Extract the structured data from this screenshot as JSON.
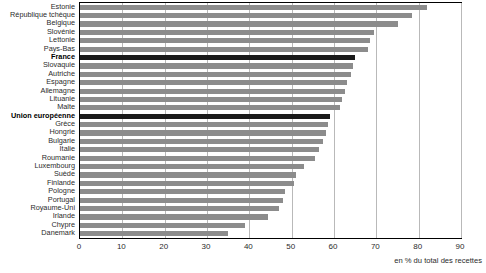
{
  "chart_data": {
    "type": "bar",
    "orientation": "horizontal",
    "title": "",
    "xlabel": "en % du total des recettes",
    "ylabel": "",
    "xlim": [
      0,
      90
    ],
    "xticks": [
      0,
      10,
      20,
      30,
      40,
      50,
      60,
      70,
      80,
      90
    ],
    "grid": true,
    "legend": null,
    "bar_color": "#8c8c8c",
    "highlight_color": "#1a1a1a",
    "categories": [
      "Estonie",
      "République tchèque",
      "Belgique",
      "Slovénie",
      "Lettonie",
      "Pays-Bas",
      "France",
      "Slovaquie",
      "Autriche",
      "Espagne",
      "Allemagne",
      "Lituanie",
      "Malte",
      "Union européenne",
      "Grèce",
      "Hongrie",
      "Bulgarie",
      "Italie",
      "Roumanie",
      "Luxembourg",
      "Suède",
      "Finlande",
      "Pologne",
      "Portugal",
      "Royaume-Uni",
      "Irlande",
      "Chypre",
      "Danemark"
    ],
    "values": [
      82.0,
      78.5,
      75.0,
      69.5,
      68.5,
      68.0,
      65.0,
      64.5,
      64.0,
      63.0,
      62.5,
      62.0,
      61.5,
      59.0,
      58.5,
      58.0,
      57.5,
      56.5,
      55.5,
      53.0,
      51.0,
      50.5,
      48.5,
      48.0,
      47.0,
      44.5,
      39.0,
      35.0
    ],
    "highlighted": [
      "France",
      "Union européenne"
    ]
  },
  "axis": {
    "note": "en % du total des recettes",
    "tick_labels": [
      "0",
      "10",
      "20",
      "30",
      "40",
      "50",
      "60",
      "70",
      "80",
      "90"
    ]
  }
}
